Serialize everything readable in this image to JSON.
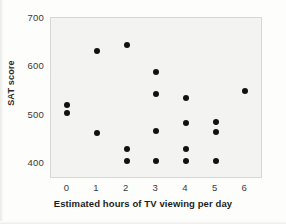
{
  "chart_data": {
    "type": "scatter",
    "title": "",
    "xlabel": "Estimated hours of TV viewing per day",
    "ylabel": "SAT score",
    "xlim": [
      -0.55,
      6.6
    ],
    "ylim": [
      367,
      700
    ],
    "xticks": [
      0,
      1,
      2,
      3,
      4,
      5,
      6
    ],
    "xtick_labels": [
      "0",
      "1",
      "2",
      "3",
      "4",
      "5",
      "6"
    ],
    "yticks": [
      400,
      500,
      600,
      700
    ],
    "ytick_labels": [
      "400",
      "500",
      "600",
      "700"
    ],
    "grid": false,
    "legend": null,
    "marker": {
      "shape": "circle",
      "color": "#111111",
      "size_px": 6
    },
    "plot_background": "#f3f3f1",
    "points": [
      {
        "x": 0,
        "y": 520
      },
      {
        "x": 0,
        "y": 504
      },
      {
        "x": 1,
        "y": 631
      },
      {
        "x": 1,
        "y": 463
      },
      {
        "x": 2,
        "y": 645
      },
      {
        "x": 2,
        "y": 429
      },
      {
        "x": 2,
        "y": 404
      },
      {
        "x": 3,
        "y": 588
      },
      {
        "x": 3,
        "y": 543
      },
      {
        "x": 3,
        "y": 467
      },
      {
        "x": 3,
        "y": 404
      },
      {
        "x": 4,
        "y": 535
      },
      {
        "x": 4,
        "y": 482
      },
      {
        "x": 4,
        "y": 429
      },
      {
        "x": 4,
        "y": 404
      },
      {
        "x": 5,
        "y": 484
      },
      {
        "x": 5,
        "y": 465
      },
      {
        "x": 5,
        "y": 404
      },
      {
        "x": 6,
        "y": 549
      }
    ]
  }
}
